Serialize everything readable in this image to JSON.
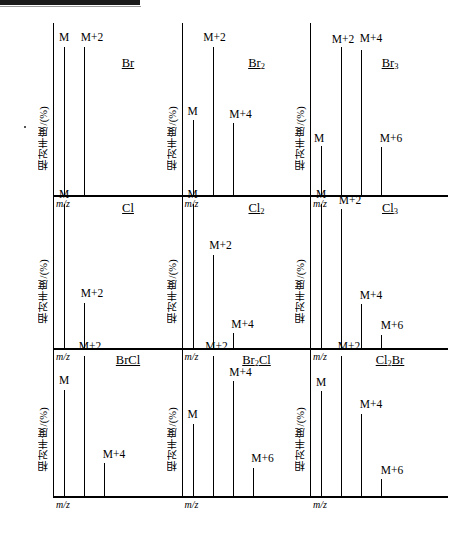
{
  "figure": {
    "axis_label_y": "相对丰度/(%)",
    "axis_label_x": "m/z",
    "top_bar_present": true
  },
  "chart_data": {
    "type": "bar",
    "xlabel": "m/z",
    "ylabel": "相对丰度/(%)",
    "ylim": [
      0,
      100
    ],
    "grid": false,
    "legend": "none",
    "panel_layout": {
      "rows": 3,
      "cols": 3
    },
    "panels": [
      {
        "id": "br1",
        "row": 0,
        "col": 0,
        "species": "Br",
        "species_sub": "",
        "categories": [
          "M",
          "M+2"
        ],
        "values": [
          100,
          100
        ]
      },
      {
        "id": "br2",
        "row": 0,
        "col": 1,
        "species": "Br",
        "species_sub": "2",
        "categories": [
          "M",
          "M+2",
          "M+4"
        ],
        "values": [
          51,
          100,
          49
        ]
      },
      {
        "id": "br3",
        "row": 0,
        "col": 2,
        "species": "Br",
        "species_sub": "3",
        "categories": [
          "M",
          "M+2",
          "M+4",
          "M+6"
        ],
        "values": [
          34,
          100,
          98,
          33
        ]
      },
      {
        "id": "cl1",
        "row": 1,
        "col": 0,
        "species": "Cl",
        "species_sub": "",
        "categories": [
          "M",
          "M+2"
        ],
        "values": [
          100,
          32
        ]
      },
      {
        "id": "cl2",
        "row": 1,
        "col": 1,
        "species": "Cl",
        "species_sub": "2",
        "categories": [
          "M",
          "M+2",
          "M+4"
        ],
        "values": [
          100,
          65,
          11
        ]
      },
      {
        "id": "cl3",
        "row": 1,
        "col": 2,
        "species": "Cl",
        "species_sub": "3",
        "categories": [
          "M",
          "M+2",
          "M+4",
          "M+6"
        ],
        "values": [
          100,
          96,
          31,
          10
        ]
      },
      {
        "id": "brcl",
        "row": 2,
        "col": 0,
        "species": "BrCl",
        "species_sub": "",
        "categories": [
          "M",
          "M+2",
          " M+4"
        ],
        "values": [
          76,
          100,
          24
        ]
      },
      {
        "id": "br2cl",
        "row": 2,
        "col": 1,
        "species_parts": [
          {
            "text": "Br"
          },
          {
            "text": "2",
            "sub": true
          },
          {
            "text": "Cl"
          }
        ],
        "species": "Br₂Cl",
        "categories": [
          "M",
          "M+2",
          "M+4",
          "M+6"
        ],
        "values": [
          52,
          100,
          82,
          21
        ]
      },
      {
        "id": "cl2br",
        "row": 2,
        "col": 2,
        "species_parts": [
          {
            "text": "Cl"
          },
          {
            "text": "2",
            "sub": true
          },
          {
            "text": "Br"
          }
        ],
        "species": "Cl₂Br",
        "categories": [
          "M",
          "M+2",
          "M+4",
          "M+6"
        ],
        "values": [
          75,
          100,
          59,
          13
        ]
      }
    ]
  },
  "panels": {
    "br1": {
      "species_main": "Br",
      "species_sub": "",
      "mz": "m/z",
      "ylabel": "相对丰度/(%)",
      "peaks": [
        {
          "label": "M",
          "value": 100
        },
        {
          "label": "M+2",
          "value": 100
        }
      ]
    },
    "br2": {
      "species_main": "Br",
      "species_sub": "2",
      "mz": "m/z",
      "ylabel": "相对丰度/(%)",
      "peaks": [
        {
          "label": "M",
          "value": 51
        },
        {
          "label": "M+2",
          "value": 100
        },
        {
          "label": "M+4",
          "value": 49
        }
      ]
    },
    "br3": {
      "species_main": "Br",
      "species_sub": "3",
      "mz": "m/z",
      "ylabel": "相对丰度/(%)",
      "peaks": [
        {
          "label": "M",
          "value": 34
        },
        {
          "label": "M+2",
          "value": 100
        },
        {
          "label": "M+4",
          "value": 98
        },
        {
          "label": "M+6",
          "value": 33
        }
      ]
    },
    "cl1": {
      "species_main": "Cl",
      "species_sub": "",
      "mz": "m/z",
      "ylabel": "相对丰度/(%)",
      "peaks": [
        {
          "label": "M",
          "value": 100
        },
        {
          "label": "M+2",
          "value": 32
        }
      ]
    },
    "cl2": {
      "species_main": "Cl",
      "species_sub": "2",
      "mz": "m/z",
      "ylabel": "相对丰度/(%)",
      "peaks": [
        {
          "label": "M",
          "value": 100
        },
        {
          "label": "M+2",
          "value": 65
        },
        {
          "label": "M+4",
          "value": 11
        }
      ]
    },
    "cl3": {
      "species_main": "Cl",
      "species_sub": "3",
      "mz": "m/z",
      "ylabel": "相对丰度/(%)",
      "peaks": [
        {
          "label": "M",
          "value": 100
        },
        {
          "label": "M+2",
          "value": 96
        },
        {
          "label": "M+4",
          "value": 31
        },
        {
          "label": "M+6",
          "value": 10
        }
      ]
    },
    "brcl": {
      "species_main": "BrCl",
      "species_sub": "",
      "mz": "m/z",
      "ylabel": "相对丰度/(%)",
      "peaks": [
        {
          "label": "M",
          "value": 76
        },
        {
          "label": "M+2",
          "value": 100
        },
        {
          "label": "M+4",
          "value": 24
        }
      ]
    },
    "br2cl": {
      "species_main": "Br",
      "species_sub": "2",
      "species_tail": "Cl",
      "mz": "m/z",
      "ylabel": "相对丰度/(%)",
      "peaks": [
        {
          "label": "M",
          "value": 52
        },
        {
          "label": "M+2",
          "value": 100
        },
        {
          "label": "M+4",
          "value": 82
        },
        {
          "label": "M+6",
          "value": 21
        }
      ]
    },
    "cl2br": {
      "species_main": "Cl",
      "species_sub": "2",
      "species_tail": "Br",
      "mz": "m/z",
      "ylabel": "相对丰度/(%)",
      "peaks": [
        {
          "label": "M",
          "value": 75
        },
        {
          "label": "M+2",
          "value": 100
        },
        {
          "label": "M+4",
          "value": 59
        },
        {
          "label": "M+6",
          "value": 13
        }
      ]
    }
  }
}
